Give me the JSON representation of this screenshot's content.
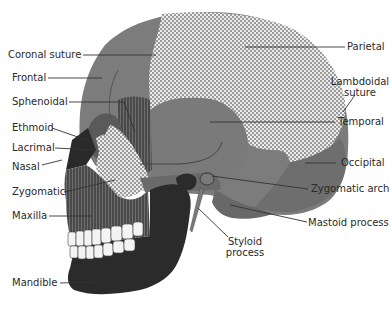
{
  "diagram": {
    "colors": {
      "cranium": "#7a7a7a",
      "dark_bone": "#2e2e2e",
      "striped_bone": "#555555",
      "checkered_light": "#e8e8e8",
      "checkered_dark": "#8a8a8a",
      "teeth": "#f4f4f4",
      "label_text": "#2a2a2a",
      "leader_line": "#333333"
    },
    "labels_left": [
      {
        "id": "coronal-suture",
        "text": "Coronal suture"
      },
      {
        "id": "frontal",
        "text": "Frontal"
      },
      {
        "id": "sphenoidal",
        "text": "Sphenoidal"
      },
      {
        "id": "ethmoid",
        "text": "Ethmoid"
      },
      {
        "id": "lacrimal",
        "text": "Lacrimal"
      },
      {
        "id": "nasal",
        "text": "Nasal"
      },
      {
        "id": "zygomatic",
        "text": "Zygomatic"
      },
      {
        "id": "maxilla",
        "text": "Maxilla"
      },
      {
        "id": "mandible",
        "text": "Mandible"
      }
    ],
    "labels_right": [
      {
        "id": "parietal",
        "text": "Parietal"
      },
      {
        "id": "lambdoidal-suture",
        "text": "Lambdoidal",
        "text2": "suture"
      },
      {
        "id": "temporal",
        "text": "Temporal"
      },
      {
        "id": "occipital",
        "text": "Occipital"
      },
      {
        "id": "zygomatic-arch",
        "text": "Zygomatic arch"
      },
      {
        "id": "mastoid-process",
        "text": "Mastoid process"
      },
      {
        "id": "styloid-process",
        "text": "Styloid",
        "text2": "process"
      }
    ]
  }
}
